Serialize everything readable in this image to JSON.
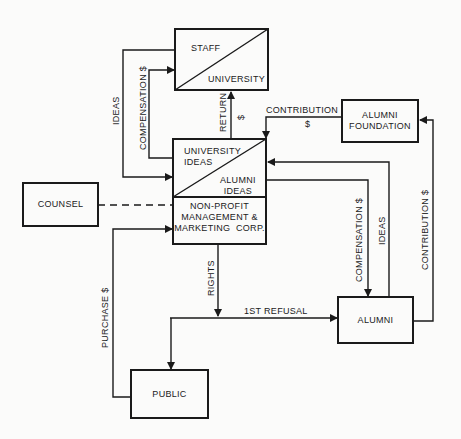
{
  "diagram": {
    "nodes": {
      "staff_university": {
        "top_label": "STAFF",
        "bottom_label": "UNIVERSITY"
      },
      "ideas_box": {
        "top_label_line1": "UNIVERSITY",
        "top_label_line2": "IDEAS",
        "bottom_label_line1": "ALUMNI",
        "bottom_label_line2": "IDEAS"
      },
      "corp": {
        "line1": "NON-PROFIT",
        "line2": "MANAGEMENT &",
        "line3": "MARKETING  CORP."
      },
      "counsel": {
        "label": "COUNSEL"
      },
      "alumni_foundation": {
        "line1": "ALUMNI",
        "line2": "FOUNDATION"
      },
      "alumni": {
        "label": "ALUMNI"
      },
      "public": {
        "label": "PUBLIC"
      }
    },
    "edges": {
      "ideas_left": "IDEAS",
      "compensation_left": "COMPENSATION $",
      "return": "RETURN",
      "return_dollar": "$",
      "contribution_top": "CONTRIBUTION",
      "contribution_top_dollar": "$",
      "compensation_right": "COMPENSATION $",
      "ideas_right": "IDEAS",
      "contribution_right": "CONTRIBUTION $",
      "rights": "RIGHTS",
      "first_refusal": "1ST REFUSAL",
      "purchase": "PURCHASE $"
    },
    "colors": {
      "ink": "#1a1a1a",
      "paper": "#fbfbfa"
    }
  }
}
